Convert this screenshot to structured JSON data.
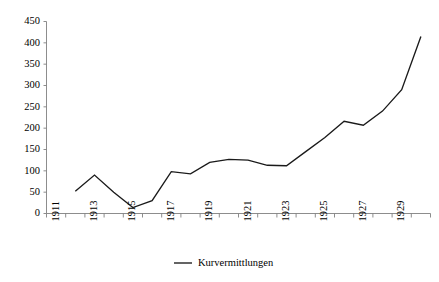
{
  "chart_data": {
    "type": "line",
    "title": "",
    "subtitle": "",
    "xlabel": "",
    "ylabel": "",
    "ylim": [
      0,
      450
    ],
    "ytick_step": 50,
    "grid": false,
    "legend_position": "bottom-center",
    "x": [
      1912,
      1913,
      1914,
      1915,
      1916,
      1917,
      1918,
      1919,
      1920,
      1921,
      1922,
      1923,
      1924,
      1925,
      1926,
      1927,
      1928,
      1929,
      1930
    ],
    "xticks": [
      1911,
      1912,
      1913,
      1914,
      1915,
      1916,
      1917,
      1918,
      1919,
      1920,
      1921,
      1922,
      1923,
      1924,
      1925,
      1926,
      1927,
      1928,
      1929,
      1930
    ],
    "xtick_labels": [
      "1911",
      "",
      "1913",
      "",
      "1915",
      "",
      "1917",
      "",
      "1919",
      "",
      "1921",
      "",
      "1923",
      "",
      "1925",
      "",
      "1927",
      "",
      "1929",
      ""
    ],
    "yticks": [
      0,
      50,
      100,
      150,
      200,
      250,
      300,
      350,
      400,
      450
    ],
    "ytick_labels": [
      "0",
      "50",
      "100",
      "150",
      "200",
      "250",
      "300",
      "350",
      "400",
      "450"
    ],
    "series": [
      {
        "name": "Kurvermittlungen",
        "color": "#1a1a1a",
        "values": [
          52,
          90,
          50,
          14,
          30,
          98,
          93,
          120,
          127,
          125,
          113,
          112,
          145,
          178,
          216,
          207,
          240,
          290,
          415
        ]
      }
    ]
  },
  "legend": {
    "entries": [
      {
        "label": "Kurvermittlungen",
        "color": "#1a1a1a"
      }
    ]
  },
  "axes": {
    "y_axis_name": "y-axis",
    "x_axis_name": "x-axis"
  }
}
